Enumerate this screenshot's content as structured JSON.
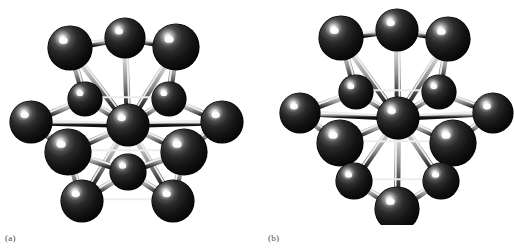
{
  "figure": {
    "background_color": "#ffffff",
    "panels": [
      {
        "id": "a",
        "label": "(a)",
        "caption_label": "(a)",
        "atom_count": 13,
        "shell_atoms": 12,
        "center_atoms": 1,
        "origin_x": 0
      },
      {
        "id": "b",
        "label": "(b)",
        "caption_label": "(b)",
        "atom_count": 13,
        "shell_atoms": 12,
        "center_atoms": 1,
        "origin_x": 257
      }
    ]
  },
  "style": {
    "sphere_base_color": "#2b2b2b",
    "sphere_dark_color": "#0a0a0a",
    "sphere_mid_color": "#1d1d1d",
    "sphere_highlight_color": "#ffffff",
    "bond_light_color": "#d8d8d8",
    "bond_mid_color": "#8c8c8c",
    "bond_dark_color": "#121212",
    "bond_edge_color": "#efefef",
    "label_color": "#4a4a4a"
  },
  "chart_data": {
    "type": "scatter",
    "title": "",
    "xlabel": "",
    "ylabel": "",
    "panels": [
      {
        "name": "(a)",
        "atoms": [
          {
            "id": "a-c",
            "x": 128,
            "y": 125,
            "r": 21,
            "role": "center",
            "layer": 2
          },
          {
            "id": "a-t1",
            "x": 70,
            "y": 48,
            "r": 22,
            "role": "shell",
            "layer": 1
          },
          {
            "id": "a-t2",
            "x": 125,
            "y": 38,
            "r": 20,
            "role": "shell",
            "layer": 1
          },
          {
            "id": "a-t3",
            "x": 176,
            "y": 47,
            "r": 23,
            "role": "shell",
            "layer": 1
          },
          {
            "id": "a-m1",
            "x": 85,
            "y": 99,
            "r": 17,
            "role": "shell",
            "layer": 2
          },
          {
            "id": "a-m2",
            "x": 169,
            "y": 99,
            "r": 17,
            "role": "shell",
            "layer": 2
          },
          {
            "id": "a-m3",
            "x": 31,
            "y": 122,
            "r": 21,
            "role": "shell",
            "layer": 2
          },
          {
            "id": "a-m4",
            "x": 222,
            "y": 122,
            "r": 21,
            "role": "shell",
            "layer": 2
          },
          {
            "id": "a-m5",
            "x": 68,
            "y": 152,
            "r": 23,
            "role": "shell",
            "layer": 2
          },
          {
            "id": "a-m6",
            "x": 184,
            "y": 152,
            "r": 23,
            "role": "shell",
            "layer": 2
          },
          {
            "id": "a-b1",
            "x": 128,
            "y": 172,
            "r": 18,
            "role": "shell",
            "layer": 3
          },
          {
            "id": "a-b2",
            "x": 82,
            "y": 201,
            "r": 21,
            "role": "shell",
            "layer": 3
          },
          {
            "id": "a-b3",
            "x": 173,
            "y": 201,
            "r": 21,
            "role": "shell",
            "layer": 3
          }
        ],
        "bonds": [
          [
            "a-c",
            "a-t1"
          ],
          [
            "a-c",
            "a-t2"
          ],
          [
            "a-c",
            "a-t3"
          ],
          [
            "a-c",
            "a-m1"
          ],
          [
            "a-c",
            "a-m2"
          ],
          [
            "a-c",
            "a-m3"
          ],
          [
            "a-c",
            "a-m4"
          ],
          [
            "a-c",
            "a-m5"
          ],
          [
            "a-c",
            "a-m6"
          ],
          [
            "a-c",
            "a-b1"
          ],
          [
            "a-c",
            "a-b2"
          ],
          [
            "a-c",
            "a-b3"
          ],
          [
            "a-t1",
            "a-t2"
          ],
          [
            "a-t2",
            "a-t3"
          ],
          [
            "a-t1",
            "a-m1"
          ],
          [
            "a-t3",
            "a-m2"
          ],
          [
            "a-m1",
            "a-m2"
          ],
          [
            "a-m3",
            "a-m1"
          ],
          [
            "a-m4",
            "a-m2"
          ],
          [
            "a-m3",
            "a-m5"
          ],
          [
            "a-m4",
            "a-m6"
          ],
          [
            "a-m5",
            "a-m6"
          ],
          [
            "a-m5",
            "a-b1"
          ],
          [
            "a-m6",
            "a-b1"
          ],
          [
            "a-b1",
            "a-b2"
          ],
          [
            "a-b1",
            "a-b3"
          ],
          [
            "a-b2",
            "a-b3"
          ],
          [
            "a-m5",
            "a-b2"
          ],
          [
            "a-m6",
            "a-b3"
          ]
        ]
      },
      {
        "name": "(b)",
        "atoms": [
          {
            "id": "b-c",
            "x": 141,
            "y": 118,
            "r": 21,
            "role": "center",
            "layer": 2
          },
          {
            "id": "b-t1",
            "x": 84,
            "y": 38,
            "r": 22,
            "role": "shell",
            "layer": 1
          },
          {
            "id": "b-t2",
            "x": 140,
            "y": 30,
            "r": 21,
            "role": "shell",
            "layer": 1
          },
          {
            "id": "b-t3",
            "x": 191,
            "y": 39,
            "r": 22,
            "role": "shell",
            "layer": 1
          },
          {
            "id": "b-m1",
            "x": 99,
            "y": 92,
            "r": 17,
            "role": "shell",
            "layer": 2
          },
          {
            "id": "b-m2",
            "x": 182,
            "y": 92,
            "r": 17,
            "role": "shell",
            "layer": 2
          },
          {
            "id": "b-m3",
            "x": 43,
            "y": 113,
            "r": 20,
            "role": "shell",
            "layer": 2
          },
          {
            "id": "b-m4",
            "x": 236,
            "y": 113,
            "r": 20,
            "role": "shell",
            "layer": 2
          },
          {
            "id": "b-m5",
            "x": 83,
            "y": 143,
            "r": 23,
            "role": "shell",
            "layer": 2
          },
          {
            "id": "b-m6",
            "x": 196,
            "y": 143,
            "r": 23,
            "role": "shell",
            "layer": 2
          },
          {
            "id": "b-b1",
            "x": 97,
            "y": 181,
            "r": 18,
            "role": "shell",
            "layer": 3
          },
          {
            "id": "b-b2",
            "x": 184,
            "y": 181,
            "r": 18,
            "role": "shell",
            "layer": 3
          },
          {
            "id": "b-b3",
            "x": 140,
            "y": 209,
            "r": 22,
            "role": "shell",
            "layer": 3
          }
        ],
        "bonds": [
          [
            "b-c",
            "b-t1"
          ],
          [
            "b-c",
            "b-t2"
          ],
          [
            "b-c",
            "b-t3"
          ],
          [
            "b-c",
            "b-m1"
          ],
          [
            "b-c",
            "b-m2"
          ],
          [
            "b-c",
            "b-m3"
          ],
          [
            "b-c",
            "b-m4"
          ],
          [
            "b-c",
            "b-m5"
          ],
          [
            "b-c",
            "b-m6"
          ],
          [
            "b-c",
            "b-b1"
          ],
          [
            "b-c",
            "b-b2"
          ],
          [
            "b-c",
            "b-b3"
          ],
          [
            "b-t1",
            "b-t2"
          ],
          [
            "b-t2",
            "b-t3"
          ],
          [
            "b-t1",
            "b-m1"
          ],
          [
            "b-t3",
            "b-m2"
          ],
          [
            "b-m1",
            "b-m2"
          ],
          [
            "b-m3",
            "b-m1"
          ],
          [
            "b-m4",
            "b-m2"
          ],
          [
            "b-m3",
            "b-m5"
          ],
          [
            "b-m4",
            "b-m6"
          ],
          [
            "b-m5",
            "b-m6"
          ],
          [
            "b-m5",
            "b-b1"
          ],
          [
            "b-m6",
            "b-b2"
          ],
          [
            "b-b1",
            "b-b2"
          ],
          [
            "b-b1",
            "b-b3"
          ],
          [
            "b-b2",
            "b-b3"
          ]
        ]
      }
    ]
  }
}
